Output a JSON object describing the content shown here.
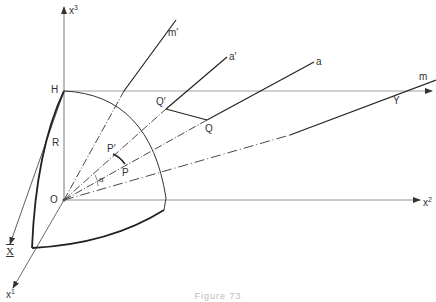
{
  "figure": {
    "caption": "Figure 73",
    "axes": {
      "x1": {
        "label": "x",
        "sup": "1"
      },
      "x2": {
        "label": "x",
        "sup": "2"
      },
      "x3": {
        "label": "x",
        "sup": "3"
      },
      "X": {
        "label": "X"
      },
      "Y": {
        "label": "Y"
      }
    },
    "points": {
      "origin": "O",
      "H": "H",
      "P": "P",
      "P_prime": "P′",
      "Q": "Q",
      "Q_prime": "Q′"
    },
    "lines": {
      "m": "m",
      "m_prime": "m′",
      "a": "a",
      "a_prime": "a′"
    },
    "radius_label": "R",
    "angle_label": "α"
  }
}
